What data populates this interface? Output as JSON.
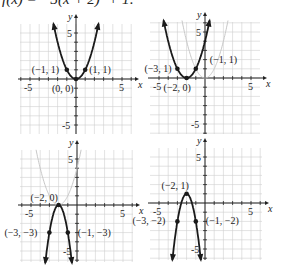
{
  "title": "f(x) = −3(x + 2)² + 1:",
  "chart_data": [
    {
      "type": "line",
      "title": "y = x²",
      "xlabel": "x",
      "ylabel": "y",
      "xlim": [
        -6,
        6
      ],
      "ylim": [
        -6,
        6
      ],
      "grid": true,
      "tick_labels": {
        "x": [
          "-5",
          "5"
        ],
        "y": [
          "5",
          "-5"
        ]
      },
      "series": [
        {
          "name": "y = x²",
          "a": 1,
          "h": 0,
          "k": 0,
          "style": "solid-dark"
        }
      ],
      "points": [
        {
          "label": "(−1, 1)",
          "x": -1,
          "y": 1
        },
        {
          "label": "(0, 0)",
          "x": 0,
          "y": 0
        },
        {
          "label": "(1, 1)",
          "x": 1,
          "y": 1
        }
      ]
    },
    {
      "type": "line",
      "title": "y = (x + 2)²",
      "xlabel": "x",
      "ylabel": "y",
      "xlim": [
        -6,
        6
      ],
      "ylim": [
        -6,
        6
      ],
      "grid": true,
      "tick_labels": {
        "x": [
          "-5",
          "5"
        ],
        "y": [
          "5",
          "-5"
        ]
      },
      "series": [
        {
          "name": "y = x² (ghost)",
          "a": 1,
          "h": 0,
          "k": 0,
          "style": "ghost"
        },
        {
          "name": "y = (x + 2)²",
          "a": 1,
          "h": -2,
          "k": 0,
          "style": "solid-dark"
        }
      ],
      "points": [
        {
          "label": "(−3, 1)",
          "x": -3,
          "y": 1
        },
        {
          "label": "(−2, 0)",
          "x": -2,
          "y": 0
        },
        {
          "label": "(−1, 1)",
          "x": -1,
          "y": 1
        }
      ]
    },
    {
      "type": "line",
      "title": "y = −3(x + 2)²",
      "xlabel": "x",
      "ylabel": "y",
      "xlim": [
        -6,
        6
      ],
      "ylim": [
        -6,
        6
      ],
      "grid": true,
      "tick_labels": {
        "x": [
          "-5",
          "5"
        ],
        "y": [
          "5",
          "-5"
        ]
      },
      "series": [
        {
          "name": "y = (x + 2)² (ghost)",
          "a": 1,
          "h": -2,
          "k": 0,
          "style": "ghost"
        },
        {
          "name": "y = −3(x + 2)²",
          "a": -3,
          "h": -2,
          "k": 0,
          "style": "solid-dark"
        }
      ],
      "points": [
        {
          "label": "(−2, 0)",
          "x": -2,
          "y": 0
        },
        {
          "label": "(−3, −3)",
          "x": -3,
          "y": -3
        },
        {
          "label": "(−1, −3)",
          "x": -1,
          "y": -3
        }
      ]
    },
    {
      "type": "line",
      "title": "y = −3(x + 2)² + 1",
      "xlabel": "x",
      "ylabel": "y",
      "xlim": [
        -6,
        6
      ],
      "ylim": [
        -6,
        6
      ],
      "grid": true,
      "tick_labels": {
        "x": [
          "-5",
          "5"
        ],
        "y": [
          "5",
          "-5"
        ]
      },
      "series": [
        {
          "name": "y = −3(x + 2)² + 1",
          "a": -3,
          "h": -2,
          "k": 1,
          "style": "solid-dark"
        }
      ],
      "points": [
        {
          "label": "(−2, 1)",
          "x": -2,
          "y": 1
        },
        {
          "label": "(−3, −2)",
          "x": -3,
          "y": -2
        },
        {
          "label": "(−1, −2)",
          "x": -1,
          "y": -2
        }
      ]
    }
  ],
  "colors": {
    "curve": "#1a1a1a",
    "ghost": "#c8c8c8",
    "grid": "#cfcfcf",
    "axis": "#222222"
  }
}
